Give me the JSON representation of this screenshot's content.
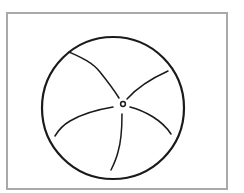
{
  "figure": {
    "type": "line-drawing",
    "frame_color": "#a9a9a9",
    "stroke_color": "#1a1a1a",
    "circle": {
      "cx": 113,
      "cy": 108,
      "r": 71
    },
    "center_ring": {
      "cx": 123,
      "cy": 104,
      "r": 2.5
    },
    "radial_lines": 5
  }
}
